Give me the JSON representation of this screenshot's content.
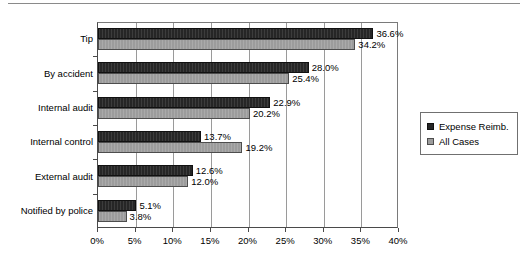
{
  "chart_data": {
    "type": "bar",
    "orientation": "horizontal",
    "title": "",
    "subtitle": "",
    "xlabel": "",
    "ylabel": "",
    "xlim": [
      0,
      40
    ],
    "xtick_labels": [
      "0%",
      "5%",
      "10%",
      "15%",
      "20%",
      "25%",
      "30%",
      "35%",
      "40%"
    ],
    "xtick_values": [
      0,
      5,
      10,
      15,
      20,
      25,
      30,
      35,
      40
    ],
    "grid": "vertical",
    "legend_position": "right-outside",
    "categories": [
      "Tip",
      "By accident",
      "Internal audit",
      "Internal control",
      "External audit",
      "Notified by police"
    ],
    "series": [
      {
        "name": "Expense Reimb.",
        "color": "#262626",
        "values": [
          36.6,
          28.0,
          22.9,
          13.7,
          12.6,
          5.1
        ],
        "labels": [
          "36.6%",
          "28.0%",
          "22.9%",
          "13.7%",
          "12.6%",
          "5.1%"
        ]
      },
      {
        "name": "All Cases",
        "color": "#9c9c9c",
        "values": [
          34.2,
          25.4,
          20.2,
          19.2,
          12.0,
          3.8
        ],
        "labels": [
          "34.2%",
          "25.4%",
          "20.2%",
          "19.2%",
          "12.0%",
          "3.8%"
        ]
      }
    ]
  },
  "legend": {
    "items": [
      {
        "label": "Expense Reimb.",
        "swatch": "dark"
      },
      {
        "label": "All Cases",
        "swatch": "light"
      }
    ]
  }
}
